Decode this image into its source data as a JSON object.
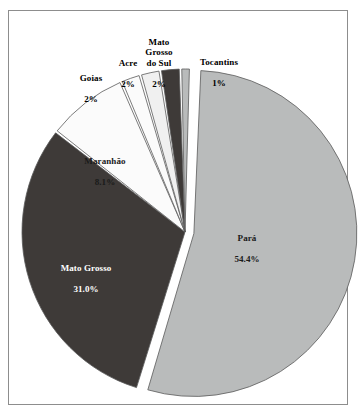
{
  "figure": {
    "title": "",
    "frame_color": "#8d8d8d",
    "background": "#ffffff"
  },
  "chart_data": {
    "type": "pie",
    "title": "",
    "xlabel": "",
    "ylabel": "",
    "legend_position": "none",
    "grid": false,
    "labels_on_slices": true,
    "exploded_slice": "Pará",
    "start_angle_deg": -88,
    "direction": "clockwise",
    "categories": [
      "Pará",
      "Mato Grosso",
      "Maranhão",
      "Goias",
      "Acre",
      "Mato Grosso do Sul",
      "Tocantins"
    ],
    "values": [
      54.4,
      31.0,
      8.1,
      2,
      2,
      2,
      1
    ],
    "value_labels": [
      "54.4%",
      "31.0%",
      "8.1%",
      "2%",
      "2%",
      "2%",
      "1%"
    ],
    "colors": [
      "#b9bbbb",
      "#3e3a38",
      "#fbfbfb",
      "#fbfbfb",
      "#f0f0f0",
      "#3e3a38",
      "#b9bbbb"
    ],
    "slices": [
      {
        "name": "Pará",
        "label": "Pará",
        "value_label": "54.4%",
        "value": 54.4,
        "color": "#b9bbbb",
        "label_color": "#1a1a1a",
        "label_placement": "inside"
      },
      {
        "name": "Mato Grosso",
        "label": "Mato Grosso",
        "value_label": "31.0%",
        "value": 31.0,
        "color": "#3e3a38",
        "label_color": "#ffffff",
        "label_placement": "inside"
      },
      {
        "name": "Maranhão",
        "label": "Maranhão",
        "value_label": "8.1%",
        "value": 8.1,
        "color": "#fbfbfb",
        "label_color": "#1a1a1a",
        "label_placement": "inside"
      },
      {
        "name": "Goias",
        "label": "Goias",
        "value_label": "2%",
        "value": 2,
        "color": "#fbfbfb",
        "label_color": "#000000",
        "label_placement": "outside"
      },
      {
        "name": "Acre",
        "label": "Acre",
        "value_label": "2%",
        "value": 2,
        "color": "#f0f0f0",
        "label_color": "#000000",
        "label_placement": "outside"
      },
      {
        "name": "Mato Grosso do Sul",
        "label": "Mato\nGrosso\ndo Sul",
        "value_label": "2%",
        "value": 2,
        "color": "#3e3a38",
        "label_color": "#000000",
        "label_placement": "outside"
      },
      {
        "name": "Tocantins",
        "label": "Tocantins",
        "value_label": "1%",
        "value": 1,
        "color": "#b9bbbb",
        "label_color": "#000000",
        "label_placement": "outside"
      }
    ]
  },
  "labels": {
    "goias": {
      "name": "Goias",
      "value": "2%"
    },
    "acre": {
      "name": "Acre",
      "value": "2%"
    },
    "mgs": {
      "name": "Mato\nGrosso\ndo Sul",
      "value": "2%"
    },
    "tocantins": {
      "name": "Tocantins",
      "value": "1%"
    },
    "maranhao": {
      "name": "Maranhão",
      "value": "8.1%"
    },
    "matogrosso": {
      "name": "Mato Grosso",
      "value": "31.0%"
    },
    "para": {
      "name": "Pará",
      "value": "54.4%"
    }
  }
}
